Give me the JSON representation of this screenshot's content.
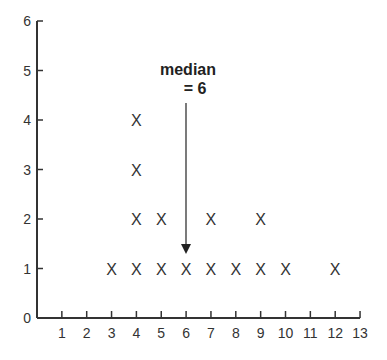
{
  "chart_data": {
    "type": "scatter",
    "subtype": "dot-plot",
    "title": "",
    "xlabel": "",
    "ylabel": "",
    "marker": "X",
    "xlim": [
      0,
      13
    ],
    "ylim": [
      0,
      6
    ],
    "x_ticks": [
      1,
      2,
      3,
      4,
      5,
      6,
      7,
      8,
      9,
      10,
      11,
      12,
      13
    ],
    "y_ticks": [
      0,
      1,
      2,
      3,
      4,
      5,
      6
    ],
    "grid": false,
    "legend": null,
    "categories": [
      3,
      4,
      5,
      6,
      7,
      8,
      9,
      10,
      12
    ],
    "values": [
      1,
      4,
      2,
      1,
      2,
      1,
      2,
      1,
      1
    ],
    "points": [
      {
        "x": 3,
        "y": 1
      },
      {
        "x": 4,
        "y": 1
      },
      {
        "x": 4,
        "y": 2
      },
      {
        "x": 4,
        "y": 3
      },
      {
        "x": 4,
        "y": 4
      },
      {
        "x": 5,
        "y": 1
      },
      {
        "x": 5,
        "y": 2
      },
      {
        "x": 6,
        "y": 1
      },
      {
        "x": 7,
        "y": 1
      },
      {
        "x": 7,
        "y": 2
      },
      {
        "x": 8,
        "y": 1
      },
      {
        "x": 9,
        "y": 1
      },
      {
        "x": 9,
        "y": 2
      },
      {
        "x": 10,
        "y": 1
      },
      {
        "x": 12,
        "y": 1
      }
    ],
    "annotations": [
      {
        "text_line1": "median",
        "text_line2": "= 6",
        "arrow_to_x": 6,
        "arrow_to_y": 1
      }
    ]
  },
  "annotation": {
    "line1": "median",
    "line2": "= 6"
  },
  "marker_symbol": "X",
  "colors": {
    "axis": "#333333",
    "text": "#333333"
  }
}
